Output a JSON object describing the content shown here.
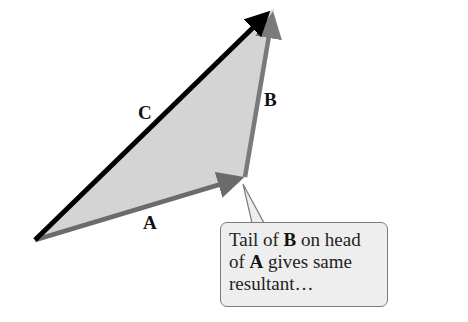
{
  "diagram": {
    "type": "vector-addition-triangle",
    "colors": {
      "fill": "#d4d4d4",
      "vector_A": "#6b6b6b",
      "vector_B": "#7a7a7a",
      "vector_C": "#000000",
      "callout_bg": "#eeeeee",
      "callout_border": "#7a7a7a"
    },
    "points": {
      "origin": [
        35,
        240
      ],
      "head_A": [
        245,
        177
      ],
      "head_B": [
        274,
        8
      ]
    },
    "labels": {
      "A": "A",
      "B": "B",
      "C": "C"
    },
    "callout": {
      "part1": "Tail of ",
      "bold1": "B",
      "part2": " on head of ",
      "bold2": "A",
      "part3": " gives same resultant…"
    }
  }
}
